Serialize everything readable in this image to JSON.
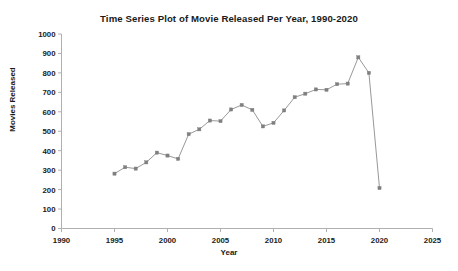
{
  "chart_data": {
    "type": "line",
    "title": "Time Series Plot of Movie Released Per Year, 1990-2020",
    "xlabel": "Year",
    "ylabel": "Movies Released",
    "xlim": [
      1990,
      2025
    ],
    "ylim": [
      0,
      1000
    ],
    "xticks": [
      1990,
      1995,
      2000,
      2005,
      2010,
      2015,
      2020,
      2025
    ],
    "yticks": [
      0,
      100,
      200,
      300,
      400,
      500,
      600,
      700,
      800,
      900,
      1000
    ],
    "grid": false,
    "legend": false,
    "marker": "square",
    "line_color": "#8c8c8c",
    "marker_color": "#7f7f7f",
    "x": [
      1995,
      1996,
      1997,
      1998,
      1999,
      2000,
      2001,
      2002,
      2003,
      2004,
      2005,
      2006,
      2007,
      2008,
      2009,
      2010,
      2011,
      2012,
      2013,
      2014,
      2015,
      2016,
      2017,
      2018,
      2019,
      2020
    ],
    "values": [
      282,
      315,
      308,
      340,
      390,
      375,
      358,
      485,
      510,
      555,
      552,
      612,
      635,
      610,
      525,
      543,
      607,
      675,
      693,
      715,
      713,
      742,
      745,
      880,
      800,
      208
    ],
    "series": [
      {
        "name": "Movies Released",
        "values": [
          282,
          315,
          308,
          340,
          390,
          375,
          358,
          485,
          510,
          555,
          552,
          612,
          635,
          610,
          525,
          543,
          607,
          675,
          693,
          715,
          713,
          742,
          745,
          880,
          800,
          208
        ]
      }
    ]
  },
  "axes": {
    "xtick_labels": [
      "1990",
      "1995",
      "2000",
      "2005",
      "2010",
      "2015",
      "2020",
      "2025"
    ],
    "ytick_labels": [
      "0",
      "100",
      "200",
      "300",
      "400",
      "500",
      "600",
      "700",
      "800",
      "900",
      "1000"
    ]
  }
}
